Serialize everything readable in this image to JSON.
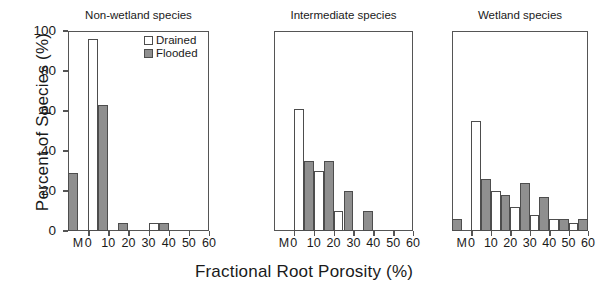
{
  "chart_data": {
    "type": "bar",
    "title": "",
    "xlabel": "Fractional Root Porosity (%)",
    "ylabel": "Percent of Species (%)",
    "ylim": [
      0,
      100
    ],
    "yticks": [
      0,
      20,
      40,
      60,
      80,
      100
    ],
    "xticks": [
      "M",
      "0",
      "10",
      "20",
      "30",
      "40",
      "50",
      "60"
    ],
    "xlim": [
      -10,
      60
    ],
    "bin_width": 5,
    "grid": false,
    "legend": {
      "position": "top-right-panel-1",
      "entries": [
        {
          "name": "Drained",
          "color": "#ffffff"
        },
        {
          "name": "Flooded",
          "color": "#8f8f8f"
        }
      ]
    },
    "panels": [
      {
        "title": "Non-wetland species",
        "bars": [
          {
            "series": "Flooded",
            "bin_start": -10,
            "bin_label": "M",
            "value": 29
          },
          {
            "series": "Drained",
            "bin_start": 0,
            "bin_label": "0-5",
            "value": 96
          },
          {
            "series": "Flooded",
            "bin_start": 5,
            "bin_label": "5-10",
            "value": 63
          },
          {
            "series": "Flooded",
            "bin_start": 15,
            "bin_label": "15-20",
            "value": 4
          },
          {
            "series": "Drained",
            "bin_start": 30,
            "bin_label": "30-35",
            "value": 4
          },
          {
            "series": "Flooded",
            "bin_start": 35,
            "bin_label": "35-40",
            "value": 4
          }
        ]
      },
      {
        "title": "Intermediate species",
        "bars": [
          {
            "series": "Drained",
            "bin_start": 0,
            "bin_label": "0-5",
            "value": 61
          },
          {
            "series": "Flooded",
            "bin_start": 5,
            "bin_label": "5-10",
            "value": 35
          },
          {
            "series": "Drained",
            "bin_start": 10,
            "bin_label": "10-15",
            "value": 30
          },
          {
            "series": "Flooded",
            "bin_start": 15,
            "bin_label": "15-20",
            "value": 35
          },
          {
            "series": "Drained",
            "bin_start": 20,
            "bin_label": "20-25",
            "value": 10
          },
          {
            "series": "Flooded",
            "bin_start": 25,
            "bin_label": "25-30",
            "value": 20
          },
          {
            "series": "Flooded",
            "bin_start": 35,
            "bin_label": "35-40",
            "value": 10
          }
        ]
      },
      {
        "title": "Wetland species",
        "bars": [
          {
            "series": "Flooded",
            "bin_start": -10,
            "bin_label": "M",
            "value": 6
          },
          {
            "series": "Drained",
            "bin_start": 0,
            "bin_label": "0-5",
            "value": 55
          },
          {
            "series": "Flooded",
            "bin_start": 5,
            "bin_label": "5-10",
            "value": 26
          },
          {
            "series": "Drained",
            "bin_start": 10,
            "bin_label": "10-15",
            "value": 20
          },
          {
            "series": "Flooded",
            "bin_start": 15,
            "bin_label": "15-20",
            "value": 18
          },
          {
            "series": "Drained",
            "bin_start": 20,
            "bin_label": "20-25",
            "value": 12
          },
          {
            "series": "Flooded",
            "bin_start": 25,
            "bin_label": "25-30",
            "value": 24
          },
          {
            "series": "Drained",
            "bin_start": 30,
            "bin_label": "30-35",
            "value": 8
          },
          {
            "series": "Flooded",
            "bin_start": 35,
            "bin_label": "35-40",
            "value": 17
          },
          {
            "series": "Drained",
            "bin_start": 40,
            "bin_label": "40-45",
            "value": 6
          },
          {
            "series": "Flooded",
            "bin_start": 45,
            "bin_label": "45-50",
            "value": 6
          },
          {
            "series": "Drained",
            "bin_start": 50,
            "bin_label": "50-55",
            "value": 4
          },
          {
            "series": "Flooded",
            "bin_start": 55,
            "bin_label": "55-60",
            "value": 6
          }
        ]
      }
    ]
  }
}
